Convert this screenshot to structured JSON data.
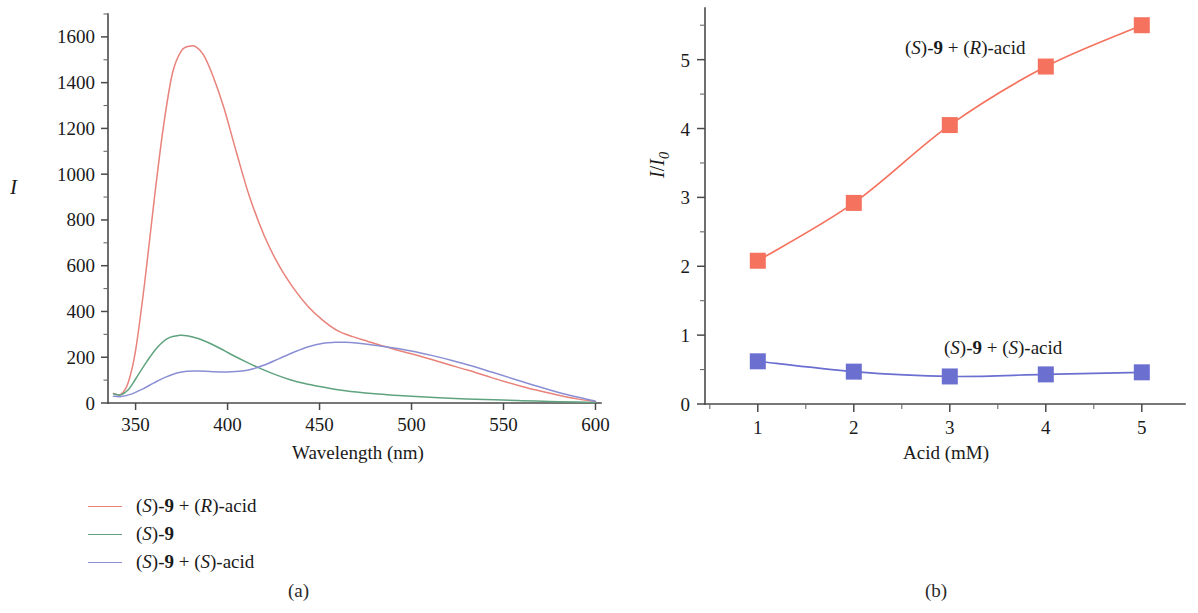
{
  "figure": {
    "panels": [
      {
        "caption": "(a)"
      },
      {
        "caption": "(b)"
      }
    ]
  },
  "panel_a": {
    "caption": "(a)",
    "ylabel": "I",
    "xlabel": "Wavelength (nm)",
    "x_ticks": [
      "350",
      "400",
      "450",
      "500",
      "550",
      "600"
    ],
    "y_ticks": [
      "0",
      "200",
      "400",
      "600",
      "800",
      "1000",
      "1200",
      "1400",
      "1600"
    ],
    "legend": [
      {
        "label_html": "(<i>S</i>)-<b>9</b> + (<i>R</i>)-acid",
        "label_text": "(S)-9 + (R)-acid",
        "color": "#E8827A"
      },
      {
        "label_html": "(<i>S</i>)-<b>9</b>",
        "label_text": "(S)-9",
        "color": "#5FA37E"
      },
      {
        "label_html": "(<i>S</i>)-<b>9</b> + (<i>S</i>)-acid",
        "label_text": "(S)-9 + (S)-acid",
        "color": "#8A8FD4"
      }
    ]
  },
  "panel_b": {
    "caption": "(b)",
    "ylabel_html": "<i>I</i>/<i>I</i><sub>0</sub>",
    "ylabel_text": "I/I0",
    "xlabel": "Acid (mM)",
    "x_ticks": [
      "1",
      "2",
      "3",
      "4",
      "5"
    ],
    "y_ticks": [
      "0",
      "1",
      "2",
      "3",
      "4",
      "5"
    ],
    "annotations": [
      {
        "html": "(<i>S</i>)-<b>9</b> + (<i>R</i>)-acid",
        "text": "(S)-9 + (R)-acid",
        "x": 905,
        "y": 38
      },
      {
        "html": "(<i>S</i>)-<b>9</b> + (<i>S</i>)-acid",
        "text": "(S)-9 + (S)-acid",
        "x": 944,
        "y": 338
      }
    ]
  },
  "chart_data": [
    {
      "type": "line",
      "panel": "(a)",
      "title": "",
      "xlabel": "Wavelength (nm)",
      "ylabel": "I",
      "xlim": [
        335,
        603
      ],
      "ylim": [
        0,
        1700
      ],
      "xticks": [
        350,
        400,
        450,
        500,
        550,
        600
      ],
      "yticks": [
        0,
        200,
        400,
        600,
        800,
        1000,
        1200,
        1400,
        1600
      ],
      "minor_tick_step_x": 10,
      "minor_tick_step_y": 100,
      "grid": false,
      "legend_position": "below-left",
      "series": [
        {
          "name": "(S)-9 + (R)-acid",
          "color": "#E8827A",
          "x": [
            338,
            342,
            346,
            350,
            355,
            360,
            365,
            370,
            375,
            380,
            383,
            387,
            392,
            398,
            405,
            412,
            420,
            428,
            436,
            444,
            452,
            460,
            468,
            476,
            484,
            492,
            500,
            510,
            520,
            530,
            540,
            550,
            560,
            570,
            580,
            590,
            600
          ],
          "y": [
            42,
            38,
            90,
            230,
            530,
            880,
            1200,
            1440,
            1540,
            1560,
            1555,
            1520,
            1430,
            1290,
            1090,
            900,
            730,
            600,
            500,
            420,
            360,
            315,
            290,
            270,
            250,
            232,
            215,
            192,
            168,
            145,
            120,
            95,
            72,
            52,
            34,
            18,
            6
          ]
        },
        {
          "name": "(S)-9",
          "color": "#5FA37E",
          "x": [
            338,
            342,
            346,
            350,
            356,
            362,
            368,
            374,
            378,
            384,
            390,
            396,
            402,
            410,
            418,
            426,
            434,
            442,
            450,
            460,
            470,
            480,
            490,
            500,
            515,
            530,
            545,
            560,
            575,
            590,
            600
          ],
          "y": [
            40,
            36,
            58,
            105,
            180,
            245,
            285,
            296,
            294,
            282,
            262,
            238,
            212,
            180,
            150,
            124,
            102,
            85,
            72,
            58,
            48,
            40,
            34,
            29,
            23,
            18,
            14,
            10,
            7,
            4,
            2
          ]
        },
        {
          "name": "(S)-9 + (S)-acid",
          "color": "#8A8FD4",
          "x": [
            338,
            342,
            348,
            354,
            360,
            366,
            372,
            378,
            384,
            392,
            400,
            408,
            414,
            420,
            428,
            436,
            444,
            452,
            458,
            464,
            470,
            478,
            486,
            494,
            502,
            512,
            522,
            532,
            544,
            556,
            568,
            580,
            590,
            600
          ],
          "y": [
            30,
            28,
            40,
            62,
            88,
            112,
            130,
            139,
            140,
            137,
            136,
            140,
            150,
            166,
            194,
            222,
            246,
            261,
            265,
            265,
            262,
            255,
            246,
            236,
            224,
            206,
            186,
            164,
            134,
            104,
            74,
            46,
            26,
            8
          ]
        }
      ]
    },
    {
      "type": "line",
      "panel": "(b)",
      "title": "",
      "xlabel": "Acid (mM)",
      "ylabel": "I/I0",
      "xlim": [
        0.45,
        5.45
      ],
      "ylim": [
        0,
        5.75
      ],
      "xticks": [
        1,
        2,
        3,
        4,
        5
      ],
      "yticks": [
        0,
        1,
        2,
        3,
        4,
        5
      ],
      "minor_tick_step_x": 0.5,
      "minor_tick_step_y": 0.5,
      "grid": false,
      "legend_position": "inline-annotations",
      "marker": "square",
      "series": [
        {
          "name": "(S)-9 + (R)-acid",
          "color": "#F4725E",
          "x": [
            1,
            2,
            3,
            4,
            5
          ],
          "y": [
            2.08,
            2.92,
            4.05,
            4.9,
            5.5
          ]
        },
        {
          "name": "(S)-9 + (S)-acid",
          "color": "#6B6FD0",
          "x": [
            1,
            2,
            3,
            4,
            5
          ],
          "y": [
            0.62,
            0.47,
            0.4,
            0.43,
            0.46
          ]
        }
      ]
    }
  ]
}
